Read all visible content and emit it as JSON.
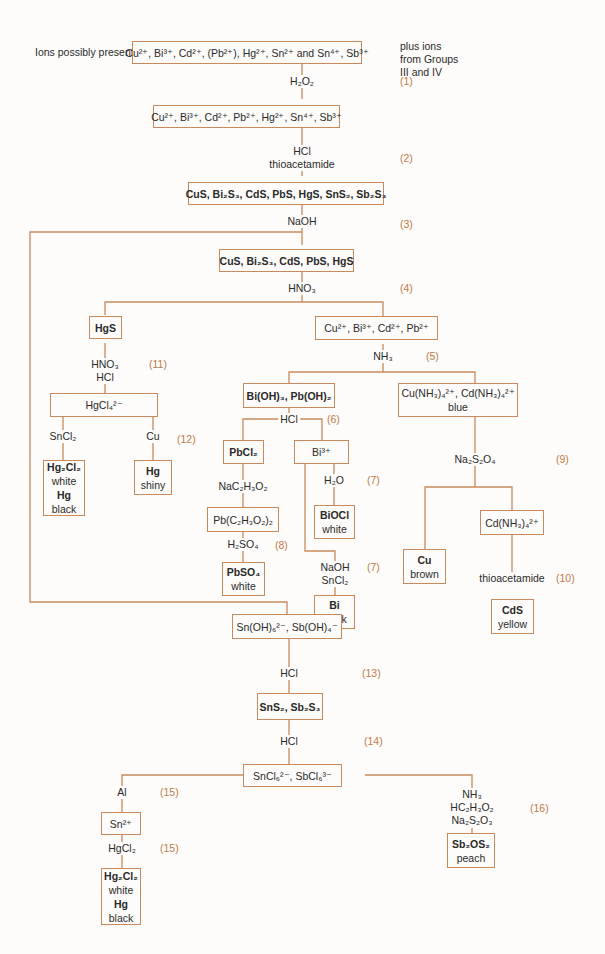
{
  "header": {
    "ions_label": "Ions possibly present:",
    "side_note": [
      "plus ions",
      "from Groups",
      "III and IV"
    ]
  },
  "colors": {
    "line": "#c88a5c",
    "step_number": "#c07a48",
    "text": "#2a2a2a",
    "background": "#fdfcfa"
  },
  "boxes": {
    "initial_ions": "Cu²⁺, Bi³⁺, Cd²⁺, (Pb²⁺), Hg²⁺, Sn²⁺ and Sn⁴⁺, Sb³⁺",
    "oxidized_ions": "Cu²⁺, Bi³⁺, Cd²⁺, Pb²⁺, Hg²⁺, Sn⁴⁺, Sb³⁺",
    "all_sulfides": "CuS, Bi₂S₃, CdS, PbS, HgS, SnS₂, Sb₂S₃",
    "group2a_sulfides": "CuS, Bi₂S₃, CdS, PbS, HgS",
    "hgs": "HgS",
    "cu_bi_cd_pb_ions": "Cu²⁺, Bi³⁺, Cd²⁺, Pb²⁺",
    "hgcl4": "HgCl₄²⁻",
    "hg2cl2_result": {
      "line1": "Hg₂Cl₂",
      "line2": "white",
      "line3": "Hg",
      "line4": "black"
    },
    "hg_shiny": {
      "line1": "Hg",
      "line2": "shiny"
    },
    "hydroxides": "Bi(OH)₃, Pb(OH)₂",
    "ammine_complexes": {
      "line1": "Cu(NH₃)₄²⁺, Cd(NH₃)₄²⁺",
      "line2": "blue"
    },
    "pbcl2": "PbCl₂",
    "bi3": "Bi³⁺",
    "lead_acetate": "Pb(C₂H₃O₂)₂",
    "biocl": {
      "line1": "BiOCl",
      "line2": "white"
    },
    "pbso4": {
      "line1": "PbSO₄",
      "line2": "white"
    },
    "bi_black": {
      "line1": "Bi",
      "line2": "black"
    },
    "cu_brown": {
      "line1": "Cu",
      "line2": "brown"
    },
    "cd_ammine": "Cd(NH₃)₄²⁺",
    "cds_yellow": {
      "line1": "CdS",
      "line2": "yellow"
    },
    "hydroxo_complexes": "Sn(OH)₆²⁻, Sb(OH)₄⁻",
    "sns2_sb2s3": "SnS₂, Sb₂S₃",
    "chloro_complexes": "SnCl₆²⁻, SbCl₆³⁻",
    "sn2": "Sn²⁺",
    "hg2cl2_result_2": {
      "line1": "Hg₂Cl₂",
      "line2": "white",
      "line3": "Hg",
      "line4": "black"
    },
    "sb2os2": {
      "line1": "Sb₂OS₂",
      "line2": "peach"
    }
  },
  "reagents": {
    "r1": "H₂O₂",
    "r2a": "HCl",
    "r2b": "thioacetamide",
    "r3": "NaOH",
    "r4": "HNO₃",
    "r11a": "HNO₃",
    "r11b": "HCl",
    "r5": "NH₃",
    "r12a": "SnCl₂",
    "r12b": "Cu",
    "r6": "HCl",
    "r_acetate": "NaC₂H₃O₂",
    "r7a": "H₂O",
    "r8": "H₂SO₄",
    "r7b1": "NaOH",
    "r7b2": "SnCl₂",
    "r9": "Na₂S₂O₄",
    "r10": "thioacetamide",
    "r13": "HCl",
    "r14": "HCl",
    "r15a": "Al",
    "r15b": "HgCl₂",
    "r16a": "NH₃",
    "r16b": "HC₂H₃O₂",
    "r16c": "Na₂S₂O₃"
  },
  "steps": {
    "s1": "(1)",
    "s2": "(2)",
    "s3": "(3)",
    "s4": "(4)",
    "s5": "(5)",
    "s6": "(6)",
    "s7a": "(7)",
    "s7b": "(7)",
    "s8": "(8)",
    "s9": "(9)",
    "s10": "(10)",
    "s11": "(11)",
    "s12": "(12)",
    "s13": "(13)",
    "s14": "(14)",
    "s15a": "(15)",
    "s15b": "(15)",
    "s16": "(16)"
  }
}
